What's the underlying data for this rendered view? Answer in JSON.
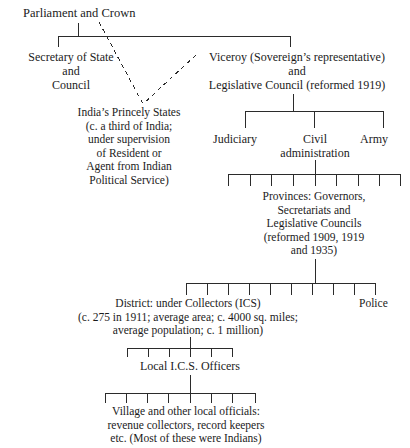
{
  "diagram": {
    "type": "organizational-hierarchy",
    "line_color": "#2b2b2b",
    "text_color": "#1b1b1b",
    "background": "#ffffff"
  },
  "nodes": {
    "parliament": {
      "id": "parliament-and-crown",
      "lines": [
        "Parliament and Crown"
      ]
    },
    "secretary": {
      "id": "secretary-of-state-and-council",
      "lines": [
        "Secretary of State",
        "and",
        "Council"
      ]
    },
    "viceroy": {
      "id": "viceroy-and-legislative-council",
      "lines": [
        "Viceroy (Sovereign’s representative)",
        "and",
        "Legislative Council (reformed 1919)"
      ]
    },
    "princely": {
      "id": "indias-princely-states",
      "lines": [
        "India’s Princely States",
        "(c. a third of India;",
        "under supervision",
        "of Resident or",
        "Agent from Indian",
        "Political Service)"
      ]
    },
    "judiciary": {
      "id": "judiciary",
      "lines": [
        "Judiciary"
      ]
    },
    "civil": {
      "id": "civil-administration",
      "lines": [
        "Civil",
        "administration"
      ]
    },
    "army": {
      "id": "army",
      "lines": [
        "Army"
      ]
    },
    "provinces": {
      "id": "provinces-governors-secretariats-legislative-councils",
      "lines": [
        "Provinces: Governors,",
        "Secretariats and",
        "Legislative Councils",
        "(reformed 1909, 1919",
        "and 1935)"
      ]
    },
    "district": {
      "id": "district-under-collectors",
      "lines": [
        "District: under Collectors (ICS)",
        "(c. 275 in 1911; average area; c. 4000 sq. miles;",
        "average population; c. 1 million)"
      ]
    },
    "police": {
      "id": "police",
      "lines": [
        "Police"
      ]
    },
    "localics": {
      "id": "local-ics-officers",
      "lines": [
        "Local I.C.S. Officers"
      ]
    },
    "village": {
      "id": "village-and-other-local-officials",
      "lines": [
        "Village and other local officials:",
        "revenue collectors, record keepers",
        "etc. (Most of these were Indians)"
      ]
    }
  },
  "edges": {
    "solid_note": "solid connector lines between levels of the hierarchy",
    "dashed_note": "dashed lines link India’s Princely States to Secretary of State and to the Viceroy"
  }
}
